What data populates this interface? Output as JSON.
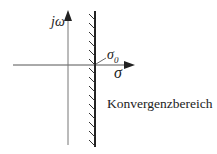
{
  "diagram": {
    "type": "complex-plane-region-of-convergence",
    "axes": {
      "vertical_label": "jω",
      "horizontal_label": "σ"
    },
    "abscissa_marker_label": "σ",
    "abscissa_marker_subscript": "0",
    "region_label": "Konvergenzbereich",
    "colors": {
      "line": "#333333",
      "text": "#222222",
      "background": "#ffffff"
    }
  }
}
